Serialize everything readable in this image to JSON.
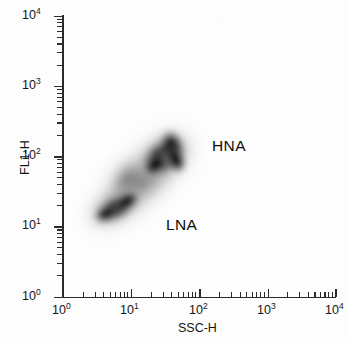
{
  "figure": {
    "kind": "flow-cytometry-cytogram",
    "background_color": "#fdfdfd",
    "ink_color": "#2b2b2b"
  },
  "axes": {
    "x_title": "SSC-H",
    "y_title": "FL1-H",
    "x_ticklabels": [
      "10",
      "10",
      "10",
      "10",
      "10"
    ],
    "x_tickexponents": [
      "0",
      "1",
      "2",
      "3",
      "4"
    ],
    "y_ticklabels": [
      "10",
      "10",
      "10",
      "10",
      "10"
    ],
    "y_tickexponents": [
      "0",
      "1",
      "2",
      "3",
      "4"
    ]
  },
  "annotations": {
    "hna": "HNA",
    "lna": "LNA"
  },
  "chart_data": {
    "type": "scatter",
    "subtype": "density-cytogram",
    "title": "",
    "xlabel": "SSC-H",
    "ylabel": "FL1-H",
    "xscale": "log",
    "yscale": "log",
    "xlim": [
      1,
      10000
    ],
    "ylim": [
      1,
      10000
    ],
    "xticks": [
      1,
      10,
      100,
      1000,
      10000
    ],
    "yticks": [
      1,
      10,
      100,
      1000,
      10000
    ],
    "xticklabels": [
      "10^0",
      "10^1",
      "10^2",
      "10^3",
      "10^4"
    ],
    "yticklabels": [
      "10^0",
      "10^1",
      "10^2",
      "10^3",
      "10^4"
    ],
    "grid": false,
    "legend": false,
    "minor_ticks": true,
    "colormap": "grayscale-density",
    "populations": [
      {
        "name": "LNA",
        "label": "LNA",
        "description": "low nucleic acid content bacteria",
        "center": {
          "x": 12,
          "y": 18
        },
        "core_extent": {
          "x_range": [
            6,
            26
          ],
          "y_range": [
            11,
            30
          ]
        },
        "halo_extent": {
          "x_range": [
            3.5,
            40
          ],
          "y_range": [
            8,
            45
          ]
        },
        "orientation_deg": -32,
        "peak_density": 1.0,
        "label_position": {
          "x": 110,
          "y": 9
        }
      },
      {
        "name": "HNA",
        "label": "HNA",
        "description": "high nucleic acid content bacteria",
        "center": {
          "x": 45,
          "y": 95
        },
        "core_extent": {
          "x_range": [
            24,
            80
          ],
          "y_range": [
            52,
            180
          ]
        },
        "halo_extent": {
          "x_range": [
            14,
            130
          ],
          "y_range": [
            33,
            270
          ]
        },
        "orientation_deg": -35,
        "peak_density": 1.0,
        "label_position": {
          "x": 210,
          "y": 150
        }
      },
      {
        "name": "bridge",
        "label": "",
        "description": "faint diffuse tail linking the two clusters toward upper-left",
        "center": {
          "x": 18,
          "y": 55
        },
        "halo_extent": {
          "x_range": [
            8,
            38
          ],
          "y_range": [
            28,
            120
          ]
        },
        "orientation_deg": -35,
        "peak_density": 0.35
      }
    ],
    "annotations": [
      {
        "text": "HNA",
        "x": 260,
        "y": 170
      },
      {
        "text": "LNA",
        "x": 95,
        "y": 9
      }
    ]
  }
}
